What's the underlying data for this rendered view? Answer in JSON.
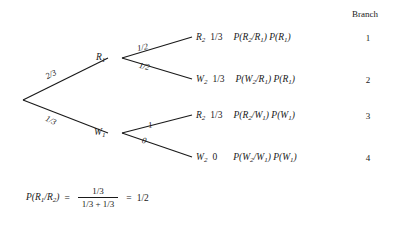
{
  "diagram": {
    "type": "probability-tree",
    "branch_column": {
      "header": "Branch",
      "numbers": [
        "1",
        "2",
        "3",
        "4"
      ]
    },
    "nodes": {
      "first_red": {
        "var": "R",
        "sub": "1"
      },
      "first_white": {
        "var": "W",
        "sub": "1"
      }
    },
    "first_stage_edges": [
      {
        "label": "2/3",
        "to": "R1"
      },
      {
        "label": "1/3",
        "to": "W1"
      }
    ],
    "second_stage_edges": [
      {
        "label": "1/2",
        "from": "R1",
        "to": "R2"
      },
      {
        "label": "1/2",
        "from": "R1",
        "to": "W2"
      },
      {
        "label": "1",
        "from": "W1",
        "to": "R2"
      },
      {
        "label": "0",
        "from": "W1",
        "to": "W2"
      }
    ],
    "outcomes": [
      {
        "var": "R",
        "var_sub": "2",
        "probability": "1/3",
        "expr_cond_var": "R",
        "expr_cond_sub": "2",
        "expr_given_var": "R",
        "expr_given_sub": "1",
        "expr_prior_var": "R",
        "expr_prior_sub": "1",
        "branch": "1"
      },
      {
        "var": "W",
        "var_sub": "2",
        "probability": "1/3",
        "expr_cond_var": "W",
        "expr_cond_sub": "2",
        "expr_given_var": "R",
        "expr_given_sub": "1",
        "expr_prior_var": "R",
        "expr_prior_sub": "1",
        "branch": "2"
      },
      {
        "var": "R",
        "var_sub": "2",
        "probability": "1/3",
        "expr_cond_var": "R",
        "expr_cond_sub": "2",
        "expr_given_var": "W",
        "expr_given_sub": "1",
        "expr_prior_var": "W",
        "expr_prior_sub": "1",
        "branch": "3"
      },
      {
        "var": "W",
        "var_sub": "2",
        "probability": "0",
        "expr_cond_var": "W",
        "expr_cond_sub": "2",
        "expr_given_var": "W",
        "expr_given_sub": "1",
        "expr_prior_var": "W",
        "expr_prior_sub": "1",
        "branch": "4"
      }
    ],
    "equation": {
      "lhs_p": "P(",
      "lhs_var1": "R",
      "lhs_sub1": "1",
      "lhs_slash": "/",
      "lhs_var2": "R",
      "lhs_sub2": "2",
      "lhs_close": ")",
      "equals": "=",
      "numerator": "1/3",
      "denominator": "1/3 + 1/3",
      "equals2": "=",
      "result": "1/2"
    },
    "colors": {
      "ink": "#1a1a1a",
      "background": "#ffffff"
    }
  }
}
